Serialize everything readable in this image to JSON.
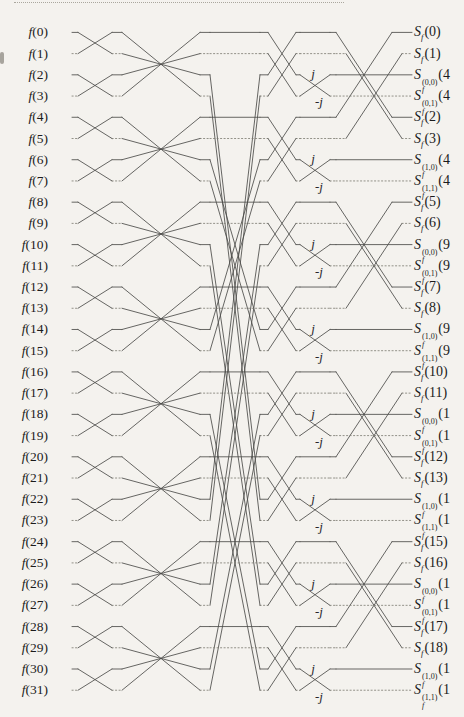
{
  "page": {
    "background": "#f4f2ee"
  },
  "diagram": {
    "colors": {
      "line": "#4c4c49",
      "dotted_line": "#7a786f",
      "text": "#1b1b1b"
    },
    "inputs": [
      "f(0)",
      "f(1)",
      "f(2)",
      "f(3)",
      "f(4)",
      "f(5)",
      "f(6)",
      "f(7)",
      "f(8)",
      "f(9)",
      "f(10)",
      "f(11)",
      "f(12)",
      "f(13)",
      "f(14)",
      "f(15)",
      "f(16)",
      "f(17)",
      "f(18)",
      "f(19)",
      "f(20)",
      "f(21)",
      "f(22)",
      "f(23)",
      "f(24)",
      "f(25)",
      "f(26)",
      "f(27)",
      "f(28)",
      "f(29)",
      "f(30)",
      "f(31)"
    ],
    "outputs": [
      {
        "base": "S",
        "sub": "f",
        "sup": null,
        "arg": "(0)"
      },
      {
        "base": "S",
        "sub": "f",
        "sup": null,
        "arg": "(1)"
      },
      {
        "base": "S",
        "sub": "f",
        "sup": "(0,0)",
        "arg": "(4"
      },
      {
        "base": "S",
        "sub": "f",
        "sup": "(0,1)",
        "arg": "(4"
      },
      {
        "base": "S",
        "sub": "f",
        "sup": null,
        "arg": "(2)"
      },
      {
        "base": "S",
        "sub": "f",
        "sup": null,
        "arg": "(3)"
      },
      {
        "base": "S",
        "sub": "f",
        "sup": "(1,0)",
        "arg": "(4"
      },
      {
        "base": "S",
        "sub": "f",
        "sup": "(1,1)",
        "arg": "(4"
      },
      {
        "base": "S",
        "sub": "f",
        "sup": null,
        "arg": "(5)"
      },
      {
        "base": "S",
        "sub": "f",
        "sup": null,
        "arg": "(6)"
      },
      {
        "base": "S",
        "sub": "f",
        "sup": "(0,0)",
        "arg": "(9"
      },
      {
        "base": "S",
        "sub": "f",
        "sup": "(0,1)",
        "arg": "(9"
      },
      {
        "base": "S",
        "sub": "f",
        "sup": null,
        "arg": "(7)"
      },
      {
        "base": "S",
        "sub": "f",
        "sup": null,
        "arg": "(8)"
      },
      {
        "base": "S",
        "sub": "f",
        "sup": "(1,0)",
        "arg": "(9"
      },
      {
        "base": "S",
        "sub": "f",
        "sup": "(1,1)",
        "arg": "(9"
      },
      {
        "base": "S",
        "sub": "f",
        "sup": null,
        "arg": "(10)"
      },
      {
        "base": "S",
        "sub": "f",
        "sup": null,
        "arg": "(11)"
      },
      {
        "base": "S",
        "sub": "f",
        "sup": "(0,0)",
        "arg": "(1"
      },
      {
        "base": "S",
        "sub": "f",
        "sup": "(0,1)",
        "arg": "(1"
      },
      {
        "base": "S",
        "sub": "f",
        "sup": null,
        "arg": "(12)"
      },
      {
        "base": "S",
        "sub": "f",
        "sup": null,
        "arg": "(13)"
      },
      {
        "base": "S",
        "sub": "f",
        "sup": "(1,0)",
        "arg": "(1"
      },
      {
        "base": "S",
        "sub": "f",
        "sup": "(1,1)",
        "arg": "(1"
      },
      {
        "base": "S",
        "sub": "f",
        "sup": null,
        "arg": "(15)"
      },
      {
        "base": "S",
        "sub": "f",
        "sup": null,
        "arg": "(16)"
      },
      {
        "base": "S",
        "sub": "f",
        "sup": "(0,0)",
        "arg": "(1"
      },
      {
        "base": "S",
        "sub": "f",
        "sup": "(0,1)",
        "arg": "(1"
      },
      {
        "base": "S",
        "sub": "f",
        "sup": null,
        "arg": "(17)"
      },
      {
        "base": "S",
        "sub": "f",
        "sup": null,
        "arg": "(18)"
      },
      {
        "base": "S",
        "sub": "f",
        "sup": "(1,0)",
        "arg": "(1"
      },
      {
        "base": "S",
        "sub": "f",
        "sup": "(1,1)",
        "arg": "(1"
      }
    ],
    "multipliers": {
      "positive": "j",
      "negative": "-j"
    },
    "network": {
      "rows": 32,
      "stage1_pairs": [
        [
          0,
          1
        ],
        [
          2,
          3
        ],
        [
          4,
          5
        ],
        [
          6,
          7
        ],
        [
          8,
          9
        ],
        [
          10,
          11
        ],
        [
          12,
          13
        ],
        [
          14,
          15
        ],
        [
          16,
          17
        ],
        [
          18,
          19
        ],
        [
          20,
          21
        ],
        [
          22,
          23
        ],
        [
          24,
          25
        ],
        [
          26,
          27
        ],
        [
          28,
          29
        ],
        [
          30,
          31
        ]
      ],
      "stage2_pairs": [
        [
          0,
          3
        ],
        [
          1,
          2
        ],
        [
          4,
          7
        ],
        [
          5,
          6
        ],
        [
          8,
          11
        ],
        [
          9,
          10
        ],
        [
          12,
          15
        ],
        [
          13,
          14
        ],
        [
          16,
          19
        ],
        [
          17,
          18
        ],
        [
          20,
          23
        ],
        [
          21,
          22
        ],
        [
          24,
          27
        ],
        [
          25,
          26
        ],
        [
          28,
          31
        ],
        [
          29,
          30
        ]
      ],
      "mid_permutation_pairs": [
        [
          2,
          22
        ],
        [
          3,
          23
        ],
        [
          6,
          14
        ],
        [
          7,
          15
        ],
        [
          10,
          26
        ],
        [
          11,
          27
        ],
        [
          18,
          30
        ],
        [
          19,
          31
        ]
      ],
      "stage3_pairs": [
        [
          0,
          2
        ],
        [
          1,
          3
        ],
        [
          4,
          6
        ],
        [
          5,
          7
        ],
        [
          8,
          10
        ],
        [
          9,
          11
        ],
        [
          12,
          14
        ],
        [
          13,
          15
        ],
        [
          16,
          18
        ],
        [
          17,
          19
        ],
        [
          20,
          22
        ],
        [
          21,
          23
        ],
        [
          24,
          26
        ],
        [
          25,
          27
        ],
        [
          28,
          30
        ],
        [
          29,
          31
        ]
      ],
      "stage4_multiplier_pairs": [
        [
          2,
          3
        ],
        [
          6,
          7
        ],
        [
          10,
          11
        ],
        [
          14,
          15
        ],
        [
          18,
          19
        ],
        [
          22,
          23
        ],
        [
          26,
          27
        ],
        [
          30,
          31
        ]
      ],
      "stage5_pairs_primary": [
        [
          0,
          4
        ],
        [
          8,
          12
        ],
        [
          16,
          20
        ],
        [
          24,
          28
        ]
      ],
      "stage5_pairs_secondary": [
        [
          1,
          5
        ],
        [
          9,
          13
        ],
        [
          17,
          21
        ],
        [
          25,
          29
        ]
      ]
    }
  }
}
